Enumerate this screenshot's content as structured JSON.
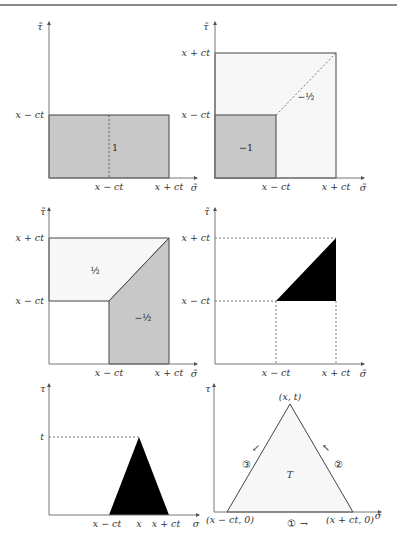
{
  "figure": {
    "panels": [
      {
        "id": "panel-1",
        "y_axis_label": "τ̃",
        "x_axis_label": "σ̃",
        "y_ticks": [
          "x − ct"
        ],
        "x_ticks": [
          "x − ct",
          "x + ct"
        ],
        "region_labels": [
          "1"
        ],
        "fill_color": "#c8c8c8"
      },
      {
        "id": "panel-2",
        "y_axis_label": "τ̃",
        "x_axis_label": "σ̃",
        "y_ticks": [
          "x + ct",
          "x − ct"
        ],
        "x_ticks": [
          "x − ct",
          "x + ct"
        ],
        "region_labels": [
          "−1",
          "−½"
        ],
        "fill_color": "#c8c8c8",
        "light_fill_color": "#f7f7f7"
      },
      {
        "id": "panel-3",
        "y_axis_label": "τ̃",
        "x_axis_label": "σ̃",
        "y_ticks": [
          "x + ct",
          "x − ct"
        ],
        "x_ticks": [
          "x − ct",
          "x + ct"
        ],
        "region_labels": [
          "½",
          "−½"
        ],
        "fill_color": "#c8c8c8",
        "light_fill_color": "#f7f7f7"
      },
      {
        "id": "panel-4",
        "y_axis_label": "τ̃",
        "x_axis_label": "σ̃",
        "y_ticks": [
          "x + ct",
          "x − ct"
        ],
        "x_ticks": [
          "x − ct",
          "x + ct"
        ],
        "fill_color": "#000000"
      },
      {
        "id": "panel-5",
        "y_axis_label": "τ",
        "x_axis_label": "σ",
        "y_ticks": [
          "t"
        ],
        "x_ticks": [
          "x − ct",
          "x",
          "x + ct"
        ],
        "fill_color": "#000000"
      },
      {
        "id": "panel-6",
        "y_axis_label": "τ",
        "x_axis_label": "σ",
        "vertex_labels": [
          "(x, t)",
          "(x − ct, 0)",
          "(x + ct, 0)"
        ],
        "region_label": "T",
        "edge_labels": [
          "①",
          "②",
          "③"
        ],
        "edge_arrows": [
          "→",
          "↖",
          "↙"
        ],
        "light_fill_color": "#f7f7f7"
      }
    ]
  }
}
